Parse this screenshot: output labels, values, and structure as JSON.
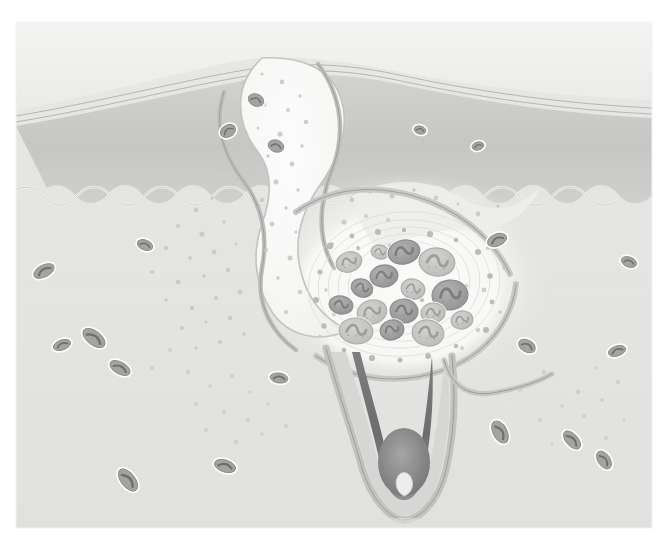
{
  "figure": {
    "title": "Cross-section of skin with inflamed acne lesion",
    "style": "grayscale medical illustration",
    "canvas": {
      "width": 667,
      "height": 545
    },
    "content_box": {
      "x": 16,
      "y": 22,
      "width": 636,
      "height": 506
    },
    "background_color": "#ffffff"
  },
  "palette": {
    "paper_white": "#ffffff",
    "stratum_corneum": "#f0f0ef",
    "corneum_line": "#9a9a9a",
    "epidermis": "#c9c9c9",
    "epidermis_shadow": "#bdbdbd",
    "dermis": "#e4e4e2",
    "dermis_light": "#ebebe9",
    "follicle_lumen": "#f7f7f6",
    "follicle_wall": "#c4c4c4",
    "follicle_wall_dark": "#a9a9a9",
    "sebaceous": "#efefed",
    "hair_shaft": "#6f6f6f",
    "hair_bulb": "#8a8a8a",
    "inflammatory_cell_dark": "#9a9a9a",
    "inflammatory_cell_light": "#c0c0c0",
    "nucleus": "#7d7d7d",
    "vessel_outline": "#ffffff",
    "granule": "#b4b4b4",
    "outline": "#8f8f8f"
  },
  "layers": [
    {
      "id": "stratum-corneum",
      "label": "Stratum corneum",
      "order": 1,
      "fill": "#f0f0ef"
    },
    {
      "id": "epidermis",
      "label": "Epidermis",
      "order": 2,
      "fill": "#c9c9c9"
    },
    {
      "id": "rete-ridges",
      "label": "Rete ridges (dermo-epidermal junction)",
      "order": 3,
      "fill": "#e4e4e2"
    },
    {
      "id": "dermis",
      "label": "Dermis",
      "order": 4,
      "fill": "#e4e4e2"
    }
  ],
  "structures": [
    {
      "id": "comedone",
      "label": "Distended follicular infundibulum (comedone)",
      "center": [
        268,
        120
      ]
    },
    {
      "id": "follicle-duct",
      "label": "Follicular duct",
      "center": [
        300,
        250
      ]
    },
    {
      "id": "rupture",
      "label": "Ruptured follicle wall",
      "center": [
        360,
        230
      ]
    },
    {
      "id": "infiltrate",
      "label": "Inflammatory cell infiltrate",
      "center": [
        405,
        285
      ]
    },
    {
      "id": "sebaceous-gland",
      "label": "Sebaceous gland lobule",
      "center": [
        460,
        250
      ]
    },
    {
      "id": "hair-follicle",
      "label": "Hair follicle bulb",
      "center": [
        400,
        440
      ]
    },
    {
      "id": "hair-shaft",
      "label": "Hair shaft",
      "center": [
        398,
        400
      ]
    }
  ],
  "inflammatory_cells": [
    {
      "cx": 349,
      "cy": 262,
      "rx": 13,
      "ry": 10,
      "rot": -18,
      "tone": "light"
    },
    {
      "cx": 380,
      "cy": 252,
      "rx": 9,
      "ry": 7,
      "rot": 12,
      "tone": "light"
    },
    {
      "cx": 404,
      "cy": 252,
      "rx": 16,
      "ry": 12,
      "rot": -12,
      "tone": "dark"
    },
    {
      "cx": 437,
      "cy": 262,
      "rx": 18,
      "ry": 14,
      "rot": 8,
      "tone": "light"
    },
    {
      "cx": 362,
      "cy": 288,
      "rx": 11,
      "ry": 9,
      "rot": 20,
      "tone": "dark"
    },
    {
      "cx": 384,
      "cy": 276,
      "rx": 14,
      "ry": 11,
      "rot": -8,
      "tone": "dark"
    },
    {
      "cx": 413,
      "cy": 289,
      "rx": 12,
      "ry": 10,
      "rot": 14,
      "tone": "light"
    },
    {
      "cx": 450,
      "cy": 295,
      "rx": 18,
      "ry": 15,
      "rot": -6,
      "tone": "dark"
    },
    {
      "cx": 341,
      "cy": 305,
      "rx": 12,
      "ry": 9,
      "rot": 10,
      "tone": "dark"
    },
    {
      "cx": 372,
      "cy": 312,
      "rx": 15,
      "ry": 12,
      "rot": -16,
      "tone": "light"
    },
    {
      "cx": 404,
      "cy": 311,
      "rx": 14,
      "ry": 12,
      "rot": 6,
      "tone": "dark"
    },
    {
      "cx": 433,
      "cy": 313,
      "rx": 12,
      "ry": 10,
      "rot": -4,
      "tone": "light"
    },
    {
      "cx": 356,
      "cy": 331,
      "rx": 17,
      "ry": 13,
      "rot": 6,
      "tone": "light"
    },
    {
      "cx": 392,
      "cy": 330,
      "rx": 12,
      "ry": 10,
      "rot": -14,
      "tone": "dark"
    },
    {
      "cx": 428,
      "cy": 333,
      "rx": 16,
      "ry": 13,
      "rot": 10,
      "tone": "light"
    },
    {
      "cx": 462,
      "cy": 320,
      "rx": 11,
      "ry": 9,
      "rot": -10,
      "tone": "light"
    }
  ],
  "vessels": [
    {
      "cx": 44,
      "cy": 271,
      "rx": 11,
      "ry": 6,
      "rot": -28
    },
    {
      "cx": 94,
      "cy": 338,
      "rx": 13,
      "ry": 7,
      "rot": 38
    },
    {
      "cx": 62,
      "cy": 345,
      "rx": 9,
      "ry": 5,
      "rot": -20
    },
    {
      "cx": 120,
      "cy": 368,
      "rx": 11,
      "ry": 6,
      "rot": 30
    },
    {
      "cx": 145,
      "cy": 245,
      "rx": 8,
      "ry": 5,
      "rot": 22
    },
    {
      "cx": 128,
      "cy": 480,
      "rx": 13,
      "ry": 7,
      "rot": 52
    },
    {
      "cx": 225,
      "cy": 466,
      "rx": 11,
      "ry": 6,
      "rot": 18
    },
    {
      "cx": 279,
      "cy": 378,
      "rx": 9,
      "ry": 5,
      "rot": 8
    },
    {
      "cx": 497,
      "cy": 240,
      "rx": 10,
      "ry": 6,
      "rot": -22
    },
    {
      "cx": 527,
      "cy": 346,
      "rx": 9,
      "ry": 6,
      "rot": 30
    },
    {
      "cx": 500,
      "cy": 432,
      "rx": 12,
      "ry": 7,
      "rot": 62
    },
    {
      "cx": 572,
      "cy": 440,
      "rx": 11,
      "ry": 6,
      "rot": 48
    },
    {
      "cx": 604,
      "cy": 460,
      "rx": 10,
      "ry": 6,
      "rot": 56
    },
    {
      "cx": 617,
      "cy": 351,
      "rx": 9,
      "ry": 5,
      "rot": -18
    },
    {
      "cx": 629,
      "cy": 262,
      "rx": 8,
      "ry": 5,
      "rot": 20
    },
    {
      "cx": 420,
      "cy": 130,
      "rx": 6,
      "ry": 4,
      "rot": 14
    },
    {
      "cx": 478,
      "cy": 146,
      "rx": 6,
      "ry": 4,
      "rot": -14
    },
    {
      "cx": 256,
      "cy": 100,
      "rx": 8,
      "ry": 6,
      "rot": 24
    },
    {
      "cx": 228,
      "cy": 131,
      "rx": 8,
      "ry": 6,
      "rot": -30
    },
    {
      "cx": 276,
      "cy": 146,
      "rx": 8,
      "ry": 6,
      "rot": 18
    }
  ]
}
